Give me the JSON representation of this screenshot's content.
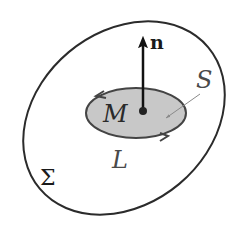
{
  "diagram": {
    "labels": {
      "normal": "n",
      "point": "M",
      "surface": "S",
      "contour": "L",
      "outer_surface": "Σ"
    },
    "colors": {
      "outer_stroke": "#2b2b2b",
      "inner_fill": "#c8c8c8",
      "inner_stroke": "#444444",
      "arrow": "#111111",
      "leader_line": "#8a8a8a"
    }
  }
}
